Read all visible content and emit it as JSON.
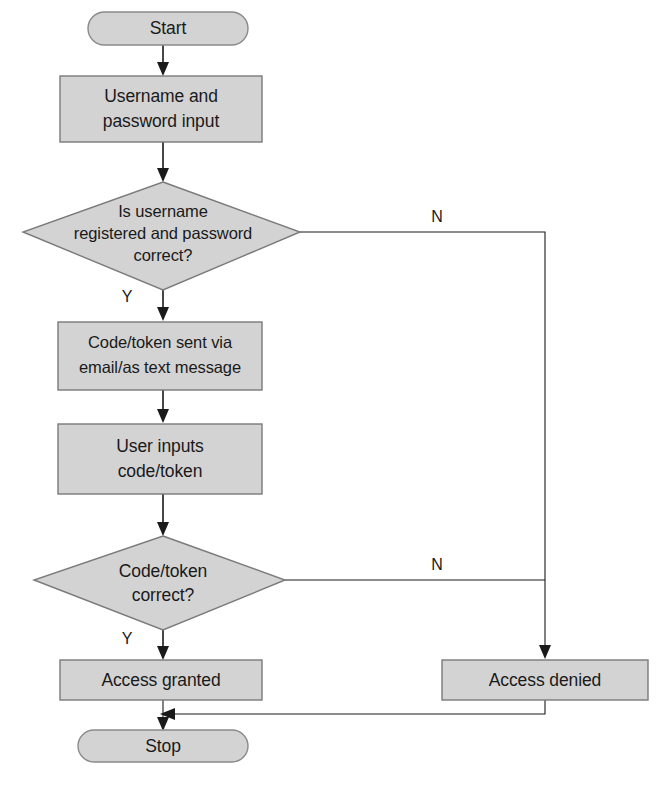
{
  "diagram": {
    "colors": {
      "node_fill": "#d3d3d3",
      "node_stroke": "#7a7a7a",
      "line": "#1a1a1a",
      "background": "#ffffff",
      "text": "#1a1a1a"
    },
    "nodes": [
      {
        "id": "start",
        "type": "terminator",
        "label": "Start"
      },
      {
        "id": "credentials-input",
        "type": "process",
        "label_line1": "Username and",
        "label_line2": "password input"
      },
      {
        "id": "credentials-check",
        "type": "decision",
        "label_line1": "Is username",
        "label_line2": "registered and password",
        "label_line3": "correct?"
      },
      {
        "id": "token-sent",
        "type": "process",
        "label_line1": "Code/token sent via",
        "label_line2": "email/as text message"
      },
      {
        "id": "token-input",
        "type": "process",
        "label_line1": "User inputs",
        "label_line2": "code/token"
      },
      {
        "id": "token-check",
        "type": "decision",
        "label_line1": "Code/token",
        "label_line2": "correct?"
      },
      {
        "id": "access-granted",
        "type": "process",
        "label": "Access granted"
      },
      {
        "id": "access-denied",
        "type": "process",
        "label": "Access denied"
      },
      {
        "id": "stop",
        "type": "terminator",
        "label": "Stop"
      }
    ],
    "branch_labels": {
      "credentials_yes": "Y",
      "credentials_no": "N",
      "token_yes": "Y",
      "token_no": "N"
    }
  }
}
